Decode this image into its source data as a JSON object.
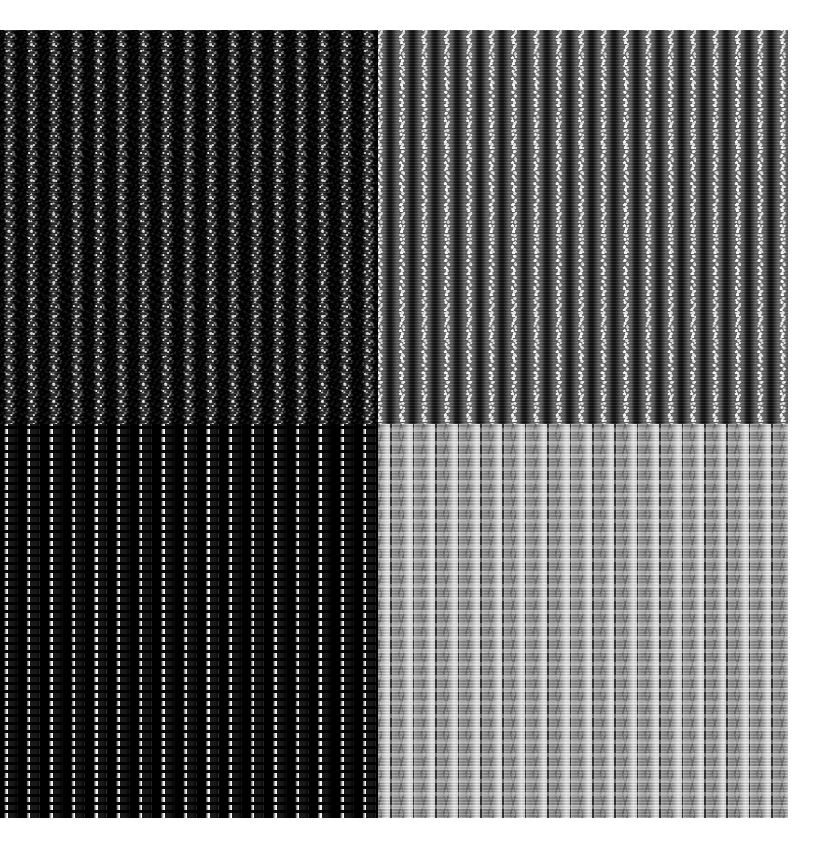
{
  "figure": {
    "kind": "texture-montage",
    "background_color": "#ffffff",
    "canvas": {
      "width": 829,
      "height": 858
    },
    "content_box": {
      "x": 0,
      "y": 30,
      "width": 788,
      "height": 788
    },
    "split": {
      "x": 378,
      "y": 424
    },
    "stripe_period_px": 22.4
  },
  "quadrants": [
    {
      "id": "top-left",
      "name": "quadrant-top-left",
      "row": 0,
      "column": 0,
      "x": 0,
      "y": 30,
      "width": 378,
      "height": 394,
      "tone": "darkest",
      "base_color": "#141414",
      "rib_color": "#3a3a3a",
      "speckle_color": "#ffffff",
      "contrast": "high-frequency fine white speckle on near-black ground",
      "stripe_count": 17
    },
    {
      "id": "top-right",
      "name": "quadrant-top-right",
      "row": 0,
      "column": 1,
      "x": 378,
      "y": 30,
      "width": 410,
      "height": 394,
      "tone": "mid-gray",
      "base_color": "#6b6b6b",
      "rib_color": "#111111",
      "speckle_color": "#ffffff",
      "contrast": "dark vertical ribs with bright granular speckle on mid-gray ground",
      "stripe_count": 18
    },
    {
      "id": "bottom-left",
      "name": "quadrant-bottom-left",
      "row": 1,
      "column": 0,
      "x": 0,
      "y": 424,
      "width": 378,
      "height": 394,
      "tone": "maximum-contrast",
      "base_color": "#0b0b0b",
      "rib_color": "#ffffff",
      "speckle_color": "#000000",
      "contrast": "blocky pure black and pure white alternating columns",
      "stripe_count": 17
    },
    {
      "id": "bottom-right",
      "name": "quadrant-bottom-right",
      "row": 1,
      "column": 1,
      "x": 378,
      "y": 424,
      "width": 410,
      "height": 394,
      "tone": "lightest",
      "base_color": "#a9a9a9",
      "rib_color": "#e4e4e4",
      "speckle_color": "#464646",
      "contrast": "soft light-gray bands with faint darker weave shading",
      "stripe_count": 18
    }
  ]
}
